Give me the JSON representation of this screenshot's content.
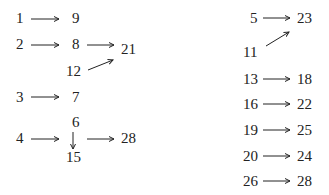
{
  "left": {
    "r1": {
      "from": "1",
      "to": "9"
    },
    "r2": {
      "from": "2",
      "mid": "8",
      "to": "21",
      "extra": "12"
    },
    "r3": {
      "from": "3",
      "to": "7"
    },
    "r4": {
      "from": "4",
      "top": "6",
      "bottom": "15",
      "to": "28"
    }
  },
  "right": {
    "r1": {
      "from": "5",
      "to": "23",
      "extra": "11"
    },
    "rows": [
      {
        "from": "13",
        "to": "18"
      },
      {
        "from": "16",
        "to": "22"
      },
      {
        "from": "19",
        "to": "25"
      },
      {
        "from": "20",
        "to": "24"
      },
      {
        "from": "26",
        "to": "28"
      }
    ]
  }
}
